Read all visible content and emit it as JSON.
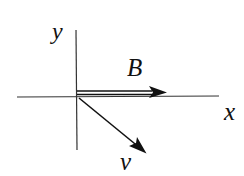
{
  "diagram": {
    "type": "vector-diagram",
    "axes": {
      "x_label": "x",
      "y_label": "y"
    },
    "vectors": [
      {
        "name": "B",
        "label": "B",
        "direction": "positive x",
        "style": "double-line arrow"
      },
      {
        "name": "v",
        "label": "v",
        "direction": "down-right, below positive x-axis",
        "style": "single-line arrow"
      }
    ],
    "colors": {
      "ink": "#111111",
      "background": "#ffffff"
    }
  }
}
